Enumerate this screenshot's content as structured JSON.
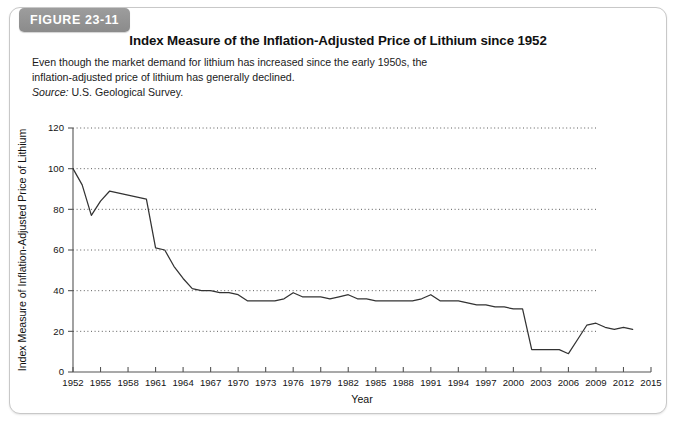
{
  "figure": {
    "badge_label": "FIGURE 23-11",
    "title": "Index Measure of the Inflation-Adjusted Price of Lithium since 1952",
    "caption_line1": "Even though the market demand for lithium has increased since the early",
    "caption_line2": "1950s, the inflation-adjusted price of lithium has generally declined.",
    "source_label": "Source:",
    "source_text": " U.S. Geological Survey."
  },
  "chart_data": {
    "type": "line",
    "title": "Index Measure of the Inflation-Adjusted Price of Lithium since 1952",
    "xlabel": "Year",
    "ylabel": "Index Measure of Inflation-Adjusted Price of Lithium",
    "xlim": [
      1952,
      2015
    ],
    "ylim": [
      0,
      120
    ],
    "yticks": [
      0,
      20,
      40,
      60,
      80,
      100,
      120
    ],
    "xticks": [
      1952,
      1955,
      1958,
      1961,
      1964,
      1967,
      1970,
      1973,
      1976,
      1979,
      1982,
      1985,
      1988,
      1991,
      1994,
      1997,
      2000,
      2003,
      2006,
      2009,
      2012,
      2015
    ],
    "grid": "horizontal-dotted",
    "legend": "none",
    "line_color": "#333333",
    "series": [
      {
        "name": "Inflation-adjusted lithium price index",
        "x": [
          1952,
          1953,
          1954,
          1955,
          1956,
          1957,
          1958,
          1959,
          1960,
          1961,
          1962,
          1963,
          1964,
          1965,
          1966,
          1967,
          1968,
          1969,
          1970,
          1971,
          1972,
          1973,
          1974,
          1975,
          1976,
          1977,
          1978,
          1979,
          1980,
          1981,
          1982,
          1983,
          1984,
          1985,
          1986,
          1987,
          1988,
          1989,
          1990,
          1991,
          1992,
          1993,
          1994,
          1995,
          1996,
          1997,
          1998,
          1999,
          2000,
          2001,
          2002,
          2003,
          2004,
          2005,
          2006,
          2007,
          2008,
          2009,
          2010,
          2011,
          2012,
          2013
        ],
        "y": [
          100,
          92,
          77,
          84,
          89,
          88,
          87,
          86,
          85,
          61,
          60,
          52,
          46,
          41,
          40,
          40,
          39,
          39,
          38,
          35,
          35,
          35,
          35,
          36,
          39,
          37,
          37,
          37,
          36,
          37,
          38,
          36,
          36,
          35,
          35,
          35,
          35,
          35,
          36,
          38,
          35,
          35,
          35,
          34,
          33,
          33,
          32,
          32,
          31,
          31,
          11,
          11,
          11,
          11,
          9,
          16,
          23,
          24,
          22,
          21,
          22,
          21
        ]
      }
    ]
  },
  "axis_labels": {
    "y": "Index Measure of Inflation-Adjusted Price of Lithium",
    "x": "Year"
  }
}
